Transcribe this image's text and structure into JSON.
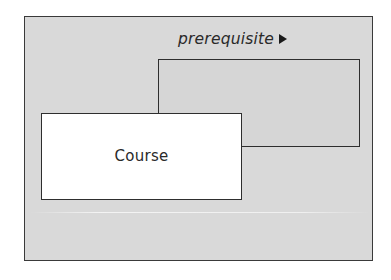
{
  "diagram": {
    "type": "class-diagram-reflexive-association",
    "frame": {
      "background": "#d9d9d9",
      "border_color": "#3a3a3a"
    },
    "association": {
      "label": "prerequisite",
      "direction_icon": "triangle-right-icon"
    },
    "classes": [
      {
        "id": "course",
        "label": "Course",
        "background": "#ffffff"
      },
      {
        "id": "prerequisite-course",
        "label": "",
        "background": "#d6d6d6"
      }
    ]
  }
}
